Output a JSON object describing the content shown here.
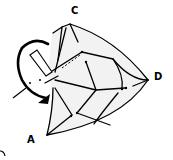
{
  "diagram": {
    "type": "origami-fold-step",
    "labels": {
      "C": "C",
      "D": "D",
      "A": "A"
    },
    "colors": {
      "stroke": "#000000",
      "paper": "#f2f2f2",
      "background": "#ffffff"
    },
    "arrow": "curved-fold-arrow"
  }
}
